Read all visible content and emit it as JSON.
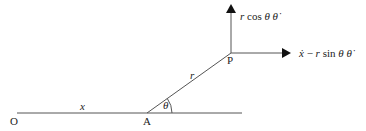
{
  "diagram": {
    "points": {
      "O": {
        "label": "O",
        "x": 17,
        "y": 113
      },
      "A": {
        "label": "A",
        "x": 147,
        "y": 113
      },
      "P": {
        "label": "P",
        "x": 231,
        "y": 53
      }
    },
    "segments": {
      "OA_label": "x",
      "AP_label": "r",
      "angle_label": "θ"
    },
    "velocity_components": {
      "vertical": {
        "text_r": "r",
        "text_cos": " cos ",
        "text_theta": "θ",
        "text_thetadot": "θ̇"
      },
      "horizontal": {
        "text_xdot": "ẋ",
        "text_minus": " − ",
        "text_r": "r",
        "text_sin": " sin ",
        "text_theta": "θ",
        "text_thetadot": "θ̇"
      }
    },
    "colors": {
      "line": "#555555",
      "arrow": "#111111",
      "text": "#222222"
    }
  }
}
